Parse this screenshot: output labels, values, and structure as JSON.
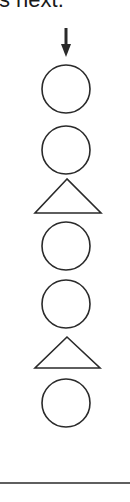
{
  "header": {
    "partial_text": "s next."
  },
  "diagram": {
    "stroke_color": "#2a2a2a",
    "arrow": {
      "direction": "down",
      "x": 66,
      "y1": 28,
      "y2": 57
    },
    "sequence": [
      {
        "shape": "circle",
        "cx": 66,
        "cy": 89,
        "r": 24
      },
      {
        "shape": "circle",
        "cx": 66,
        "cy": 150,
        "r": 24
      },
      {
        "shape": "triangle",
        "apex": [
          67,
          179
        ],
        "base_y": 213,
        "left": 35,
        "right": 101
      },
      {
        "shape": "circle",
        "cx": 66,
        "cy": 246,
        "r": 24
      },
      {
        "shape": "circle",
        "cx": 66,
        "cy": 304,
        "r": 24
      },
      {
        "shape": "triangle",
        "apex": [
          67,
          337
        ],
        "base_y": 368,
        "left": 35,
        "right": 100
      },
      {
        "shape": "circle",
        "cx": 66,
        "cy": 403,
        "r": 24
      }
    ],
    "divider_y": 483
  }
}
